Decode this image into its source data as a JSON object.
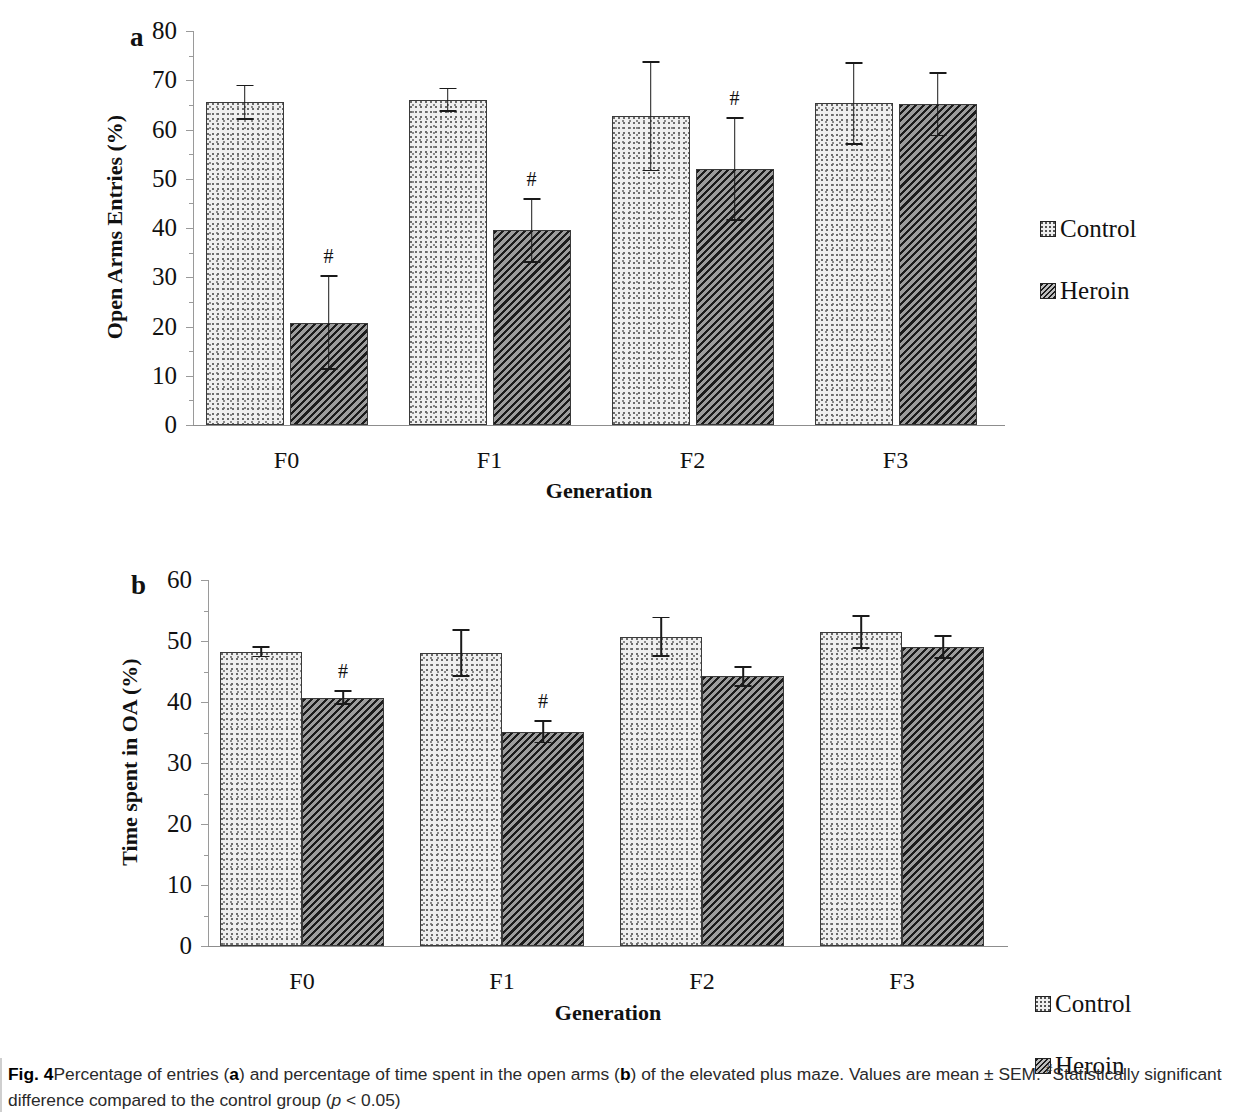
{
  "figure": {
    "label": "Fig. 4",
    "caption_part1": "Percentage of entries (",
    "caption_a": "a",
    "caption_part2": ") and percentage of time spent in the open arms (",
    "caption_b": "b",
    "caption_part3": ") of the elevated plus maze. Values are mean ± SEM. ",
    "caption_sup": "#",
    "caption_part4": "Statistically significant difference compared to the control group (",
    "caption_p": "p",
    "caption_part5": " < 0.05)"
  },
  "legend": {
    "control_label": "Control",
    "heroin_label": "Heroin"
  },
  "panel_a": {
    "letter": "a"
  },
  "panel_b": {
    "letter": "b"
  },
  "chart_data": [
    {
      "type": "bar",
      "panel": "a",
      "title": "",
      "xlabel": "Generation",
      "ylabel": "Open Arms Entries (%)",
      "ylim": [
        0,
        80
      ],
      "yticks": [
        0,
        10,
        20,
        30,
        40,
        50,
        60,
        70,
        80
      ],
      "ytick_labels": [
        "0",
        "10",
        "20",
        "30",
        "40",
        "50",
        "60",
        "70",
        "80"
      ],
      "grid": false,
      "legend_position": "right",
      "categories": [
        "F0",
        "F1",
        "F2",
        "F3"
      ],
      "series": [
        {
          "name": "Control",
          "values": [
            65.5,
            66.0,
            62.7,
            65.3
          ],
          "errors": [
            3.6,
            2.5,
            11.2,
            8.4
          ],
          "significance": [
            "",
            "",
            "",
            ""
          ]
        },
        {
          "name": "Heroin",
          "values": [
            20.8,
            39.5,
            52.0,
            65.1
          ],
          "errors": [
            9.6,
            6.6,
            10.5,
            6.5
          ],
          "significance": [
            "#",
            "#",
            "#",
            ""
          ]
        }
      ]
    },
    {
      "type": "bar",
      "panel": "b",
      "title": "",
      "xlabel": "Generation",
      "ylabel": "Time spent in OA (%)",
      "ylim": [
        0,
        60
      ],
      "yticks": [
        0,
        10,
        20,
        30,
        40,
        50,
        60
      ],
      "ytick_labels": [
        "0",
        "10",
        "20",
        "30",
        "40",
        "50",
        "60"
      ],
      "grid": false,
      "legend_position": "right",
      "categories": [
        "F0",
        "F1",
        "F2",
        "F3"
      ],
      "series": [
        {
          "name": "Control",
          "values": [
            48.2,
            48.0,
            50.7,
            51.5
          ],
          "errors": [
            0.9,
            3.9,
            3.3,
            2.8
          ],
          "significance": [
            "",
            "",
            "",
            ""
          ]
        },
        {
          "name": "Heroin",
          "values": [
            40.7,
            35.1,
            44.2,
            49.0
          ],
          "errors": [
            1.2,
            1.9,
            1.7,
            2.0
          ],
          "significance": [
            "#",
            "#",
            "",
            ""
          ]
        }
      ]
    }
  ]
}
